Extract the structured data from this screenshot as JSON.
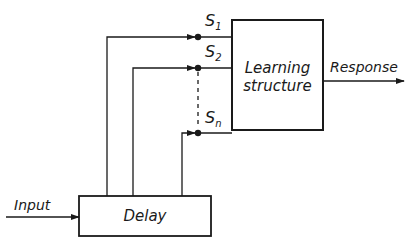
{
  "diagram": {
    "colors": {
      "line": "#1a1a1a",
      "background": "#ffffff"
    },
    "blocks": {
      "learning_structure": {
        "line1": "Learning",
        "line2": "structure"
      },
      "delay": {
        "label": "Delay"
      }
    },
    "signals": {
      "input": "Input",
      "response": "Response",
      "s1": {
        "base": "S",
        "sub": "1"
      },
      "s2": {
        "base": "S",
        "sub": "2"
      },
      "sn": {
        "base": "S",
        "sub": "n"
      }
    }
  }
}
